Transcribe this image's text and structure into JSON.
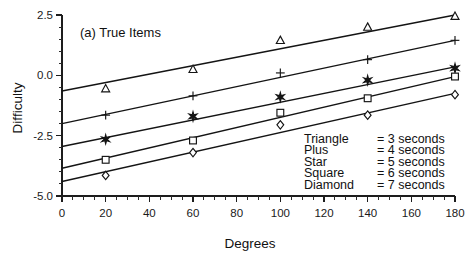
{
  "chart_data": {
    "type": "scatter",
    "title": "(a) True Items",
    "xlabel": "Degrees",
    "ylabel": "Difficulty",
    "xlim": [
      0,
      180
    ],
    "ylim": [
      -5.0,
      2.5
    ],
    "grid": false,
    "legend_position": "inside-bottom-right",
    "xticks": [
      "0",
      "20",
      "40",
      "60",
      "80",
      "100",
      "120",
      "140",
      "160",
      "180"
    ],
    "xtick_values": [
      0,
      20,
      40,
      60,
      80,
      100,
      120,
      140,
      160,
      180
    ],
    "yticks": [
      "2.5",
      "0.0",
      "-2.5",
      "-5.0"
    ],
    "ytick_values": [
      2.5,
      0.0,
      -2.5,
      -5.0
    ],
    "x": [
      20,
      60,
      100,
      140,
      180
    ],
    "series": [
      {
        "name": "Triangle",
        "marker": "triangle-open",
        "legend_label": "Triangle",
        "legend_value": "= 3 seconds",
        "seconds": 3,
        "values": [
          -0.55,
          0.25,
          1.45,
          2.0,
          2.45
        ],
        "fit_line": [
          -0.65,
          2.5
        ]
      },
      {
        "name": "Plus",
        "marker": "plus",
        "legend_label": "Plus",
        "legend_value": "= 4 seconds",
        "seconds": 4,
        "values": [
          -1.65,
          -0.85,
          0.1,
          0.65,
          1.45
        ],
        "fit_line": [
          -2.0,
          1.45
        ]
      },
      {
        "name": "Star",
        "marker": "star-solid",
        "legend_label": "Star",
        "legend_value": "= 5 seconds",
        "seconds": 5,
        "values": [
          -2.65,
          -1.7,
          -0.9,
          -0.2,
          0.3
        ],
        "fit_line": [
          -2.95,
          0.35
        ]
      },
      {
        "name": "Square",
        "marker": "square-open",
        "legend_label": "Square",
        "legend_value": "= 6 seconds",
        "seconds": 6,
        "values": [
          -3.5,
          -2.7,
          -1.55,
          -0.95,
          -0.05
        ],
        "fit_line": [
          -3.85,
          -0.05
        ]
      },
      {
        "name": "Diamond",
        "marker": "diamond-open",
        "legend_label": "Diamond",
        "legend_value": "= 7 seconds",
        "seconds": 7,
        "values": [
          -4.15,
          -3.2,
          -2.05,
          -1.65,
          -0.8
        ],
        "fit_line": [
          -4.4,
          -0.75
        ]
      }
    ]
  },
  "colors": {
    "ink": "#141414",
    "background": "#ffffff"
  }
}
